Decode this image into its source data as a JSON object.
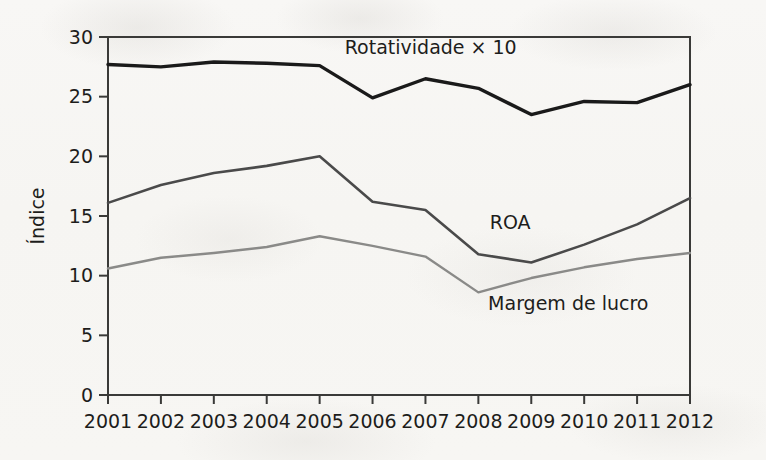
{
  "chart_data": {
    "type": "line",
    "title": "",
    "xlabel": "",
    "ylabel": "Índice",
    "x": [
      2001,
      2002,
      2003,
      2004,
      2005,
      2006,
      2007,
      2008,
      2009,
      2010,
      2011,
      2012
    ],
    "categories": [
      "2001",
      "2002",
      "2003",
      "2004",
      "2005",
      "2006",
      "2007",
      "2008",
      "2009",
      "2010",
      "2011",
      "2012"
    ],
    "xlim": [
      2001,
      2012
    ],
    "ylim": [
      0,
      30
    ],
    "yticks": [
      0,
      5,
      10,
      15,
      20,
      25,
      30
    ],
    "ytick_labels": [
      "0",
      "5",
      "10",
      "15",
      "20",
      "25",
      "30"
    ],
    "grid": false,
    "legend_position": "inline-annotations",
    "series": [
      {
        "name": "Rotatividade × 10",
        "color": "#1a1a1a",
        "stroke_width": 3.4,
        "values": [
          27.7,
          27.5,
          27.9,
          27.8,
          27.6,
          24.9,
          26.5,
          25.7,
          23.5,
          24.6,
          24.5,
          26.0
        ],
        "label_x": 2007.1,
        "label_y": 28.6,
        "label_anchor": "middle"
      },
      {
        "name": "ROA",
        "color": "#4a4a4a",
        "stroke_width": 2.6,
        "values": [
          16.1,
          17.6,
          18.6,
          19.2,
          20.0,
          16.2,
          15.5,
          11.8,
          11.1,
          12.6,
          14.3,
          16.5
        ],
        "label_x": 2008.6,
        "label_y": 13.9,
        "label_anchor": "middle"
      },
      {
        "name": "Margem de lucro",
        "color": "#8a8a88",
        "stroke_width": 2.4,
        "values": [
          10.6,
          11.5,
          11.9,
          12.4,
          13.3,
          12.5,
          11.6,
          8.6,
          9.8,
          10.7,
          11.4,
          11.9
        ],
        "label_x": 2009.7,
        "label_y": 7.1,
        "label_anchor": "middle"
      }
    ]
  },
  "figure": {
    "background_color": "#f7f6f4",
    "axis_color": "#3a3a38",
    "text_color": "#1d1d1b"
  }
}
